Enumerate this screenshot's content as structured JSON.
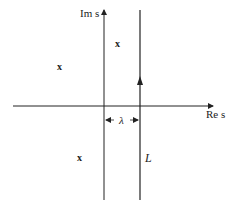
{
  "diagram": {
    "type": "complex-plane contour",
    "axes": {
      "imag_label": "Im s",
      "real_label": "Re s"
    },
    "contour": {
      "label": "L",
      "description": "vertical line Re s = λ, directed upward"
    },
    "offset": {
      "label": "λ"
    },
    "poles": [
      {
        "symbol": "x",
        "position": "upper right of Im axis"
      },
      {
        "symbol": "x",
        "position": "upper left"
      },
      {
        "symbol": "x",
        "position": "lower left"
      }
    ],
    "colors": {
      "ink": "#222222",
      "background": "#ffffff"
    }
  }
}
